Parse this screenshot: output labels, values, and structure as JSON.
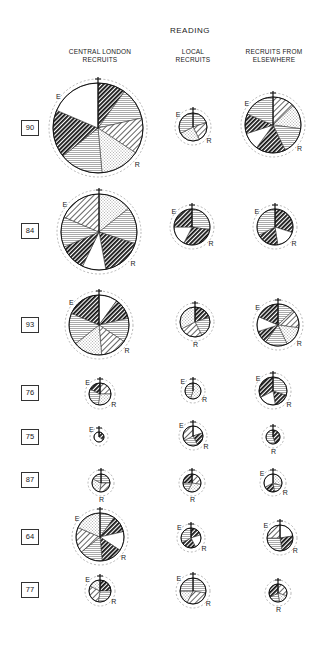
{
  "title": "READING",
  "columns": [
    {
      "id": "central",
      "label_line1": "CENTRAL LONDON",
      "label_line2": "RECRUITS"
    },
    {
      "id": "local",
      "label_line1": "LOCAL",
      "label_line2": "RECRUITS"
    },
    {
      "id": "elsewhere",
      "label_line1": "RECRUITS FROM",
      "label_line2": "ELSEWHERE"
    }
  ],
  "rows": [
    {
      "label": "90",
      "y": 129
    },
    {
      "label": "84",
      "y": 232
    },
    {
      "label": "93",
      "y": 325
    },
    {
      "label": "76",
      "y": 393
    },
    {
      "label": "75",
      "y": 437
    },
    {
      "label": "87",
      "y": 480
    },
    {
      "label": "64",
      "y": 537
    },
    {
      "label": "77",
      "y": 590
    }
  ],
  "axis_labels": {
    "east": "E",
    "right": "R"
  },
  "pattern_legend": [
    "solid-diagonal-hatch",
    "light-diagonal-hatch",
    "horizontal-line-hatch",
    "stipple",
    "blank"
  ],
  "circles": [
    {
      "row": "90",
      "col": "central",
      "cx": 98,
      "cy": 128,
      "r": 45,
      "labels": [
        "E",
        "R"
      ]
    },
    {
      "row": "90",
      "col": "local",
      "cx": 193,
      "cy": 127,
      "r": 14,
      "labels": [
        "E",
        "R"
      ]
    },
    {
      "row": "90",
      "col": "elsewhere",
      "cx": 273,
      "cy": 125,
      "r": 28,
      "labels": [
        "E",
        "R"
      ]
    },
    {
      "row": "84",
      "col": "central",
      "cx": 99,
      "cy": 232,
      "r": 38,
      "labels": [
        "E",
        "R"
      ]
    },
    {
      "row": "84",
      "col": "local",
      "cx": 192,
      "cy": 227,
      "r": 18,
      "labels": [
        "E",
        "R"
      ]
    },
    {
      "row": "84",
      "col": "elsewhere",
      "cx": 275,
      "cy": 227,
      "r": 18,
      "labels": [
        "E",
        "R"
      ]
    },
    {
      "row": "93",
      "col": "central",
      "cx": 99,
      "cy": 325,
      "r": 30,
      "labels": [
        "E",
        "R"
      ]
    },
    {
      "row": "93",
      "col": "local",
      "cx": 195,
      "cy": 322,
      "r": 15,
      "labels": [
        "R"
      ]
    },
    {
      "row": "93",
      "col": "elsewhere",
      "cx": 278,
      "cy": 325,
      "r": 21,
      "labels": [
        "E",
        "R"
      ]
    },
    {
      "row": "76",
      "col": "central",
      "cx": 100,
      "cy": 394,
      "r": 11,
      "labels": [
        "E",
        "R"
      ]
    },
    {
      "row": "76",
      "col": "local",
      "cx": 193,
      "cy": 391,
      "r": 8,
      "labels": [
        "E",
        "R"
      ]
    },
    {
      "row": "76",
      "col": "elsewhere",
      "cx": 273,
      "cy": 391,
      "r": 14,
      "labels": [
        "E",
        "R"
      ]
    },
    {
      "row": "75",
      "col": "central",
      "cx": 99,
      "cy": 437,
      "r": 5,
      "labels": [
        "E"
      ]
    },
    {
      "row": "75",
      "col": "local",
      "cx": 193,
      "cy": 436,
      "r": 10,
      "labels": [
        "E",
        "R"
      ]
    },
    {
      "row": "75",
      "col": "elsewhere",
      "cx": 273,
      "cy": 437,
      "r": 7,
      "labels": [
        "R"
      ]
    },
    {
      "row": "87",
      "col": "central",
      "cx": 101,
      "cy": 483,
      "r": 9,
      "labels": [
        "R"
      ]
    },
    {
      "row": "87",
      "col": "local",
      "cx": 192,
      "cy": 483,
      "r": 9,
      "labels": [
        "R"
      ]
    },
    {
      "row": "87",
      "col": "elsewhere",
      "cx": 273,
      "cy": 483,
      "r": 9,
      "labels": [
        "E",
        "R"
      ]
    },
    {
      "row": "64",
      "col": "central",
      "cx": 100,
      "cy": 537,
      "r": 24,
      "labels": [
        "E",
        "R"
      ]
    },
    {
      "row": "64",
      "col": "local",
      "cx": 191,
      "cy": 538,
      "r": 10,
      "labels": [
        "E",
        "R"
      ]
    },
    {
      "row": "64",
      "col": "elsewhere",
      "cx": 280,
      "cy": 538,
      "r": 13,
      "labels": [
        "E",
        "R"
      ]
    },
    {
      "row": "77",
      "col": "central",
      "cx": 100,
      "cy": 591,
      "r": 11,
      "labels": [
        "E",
        "R"
      ]
    },
    {
      "row": "77",
      "col": "local",
      "cx": 193,
      "cy": 591,
      "r": 13,
      "labels": [
        "E",
        "R"
      ]
    },
    {
      "row": "77",
      "col": "elsewhere",
      "cx": 278,
      "cy": 593,
      "r": 9,
      "labels": [
        "R"
      ]
    }
  ]
}
